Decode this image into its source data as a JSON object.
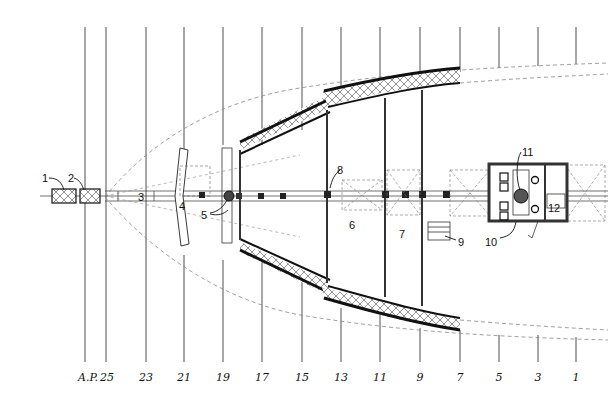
{
  "diagram": {
    "type": "ship stern deck plan",
    "colors": {
      "ink": "#111111",
      "paper": "#ffffff",
      "hatch": "#555555",
      "dashed": "#888888"
    },
    "stations": [
      {
        "label": "A.P.",
        "x": 88
      },
      {
        "label": "25",
        "x": 107
      },
      {
        "label": "23",
        "x": 146
      },
      {
        "label": "21",
        "x": 184
      },
      {
        "label": "19",
        "x": 223
      },
      {
        "label": "17",
        "x": 262
      },
      {
        "label": "15",
        "x": 302
      },
      {
        "label": "13",
        "x": 341
      },
      {
        "label": "11",
        "x": 380
      },
      {
        "label": "9",
        "x": 420
      },
      {
        "label": "7",
        "x": 460
      },
      {
        "label": "5",
        "x": 499
      },
      {
        "label": "3",
        "x": 538
      },
      {
        "label": "1",
        "x": 576
      }
    ],
    "callouts": [
      {
        "label": "1",
        "x": 42,
        "y": 173
      },
      {
        "label": "2",
        "x": 68,
        "y": 173
      },
      {
        "label": "3",
        "x": 138,
        "y": 192
      },
      {
        "label": "4",
        "x": 179,
        "y": 201
      },
      {
        "label": "5",
        "x": 201,
        "y": 210
      },
      {
        "label": "6",
        "x": 349,
        "y": 220
      },
      {
        "label": "7",
        "x": 399,
        "y": 229
      },
      {
        "label": "8",
        "x": 337,
        "y": 165
      },
      {
        "label": "9",
        "x": 458,
        "y": 237
      },
      {
        "label": "10",
        "x": 485,
        "y": 237
      },
      {
        "label": "11",
        "x": 522,
        "y": 147
      },
      {
        "label": "12",
        "x": 548,
        "y": 203
      }
    ]
  }
}
